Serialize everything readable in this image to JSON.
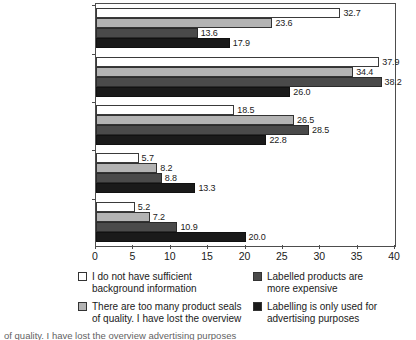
{
  "chart_data": {
    "type": "bar",
    "orientation": "horizontal",
    "title": "",
    "xlabel": "",
    "ylabel": "",
    "xlim": [
      0,
      40
    ],
    "xticks": [
      0,
      5,
      10,
      15,
      20,
      25,
      30,
      35,
      40
    ],
    "grid": false,
    "legend_position": "bottom",
    "categories": [
      "Strongly agree",
      "Agree",
      "Disagree",
      "Strongly disagree",
      "Unsure"
    ],
    "series": [
      {
        "name": "I do not have sufficient\nbackground information",
        "color": "#ffffff",
        "values": [
          32.7,
          37.9,
          18.5,
          5.7,
          5.2
        ],
        "labels": [
          "32.7",
          "37.9",
          "18.5",
          "5.7",
          "5.2"
        ]
      },
      {
        "name": "There are too many product seals\nof quality. I have lost the overview",
        "color": "#b3b3b3",
        "values": [
          23.6,
          34.4,
          26.5,
          8.2,
          7.2
        ],
        "labels": [
          "23.6",
          "34.4",
          "26.5",
          "8.2",
          "7.2"
        ]
      },
      {
        "name": "Labelled products are\nmore expensive",
        "color": "#4a4a4a",
        "values": [
          13.6,
          38.2,
          28.5,
          8.8,
          10.9
        ],
        "labels": [
          "13.6",
          "38.2",
          "28.5",
          "8.8",
          "10.9"
        ]
      },
      {
        "name": "Labelling is only used for\nadvertising purposes",
        "color": "#1a1a1a",
        "values": [
          17.9,
          26.0,
          22.8,
          13.3,
          20.0
        ],
        "labels": [
          "17.9",
          "26.0",
          "22.8",
          "13.3",
          "20.0"
        ]
      }
    ]
  },
  "legend": {
    "items": [
      {
        "swatch": "s0",
        "label": "I do not have sufficient\nbackground information"
      },
      {
        "swatch": "s2",
        "label": "Labelled products are\nmore expensive"
      },
      {
        "swatch": "s1",
        "label": "There are too many product seals\nof quality. I have lost the overview"
      },
      {
        "swatch": "s3",
        "label": "Labelling is only used for\nadvertising purposes"
      }
    ]
  },
  "caption": {
    "partial_text": "of quality. I have lost the overview          advertising purposes"
  }
}
